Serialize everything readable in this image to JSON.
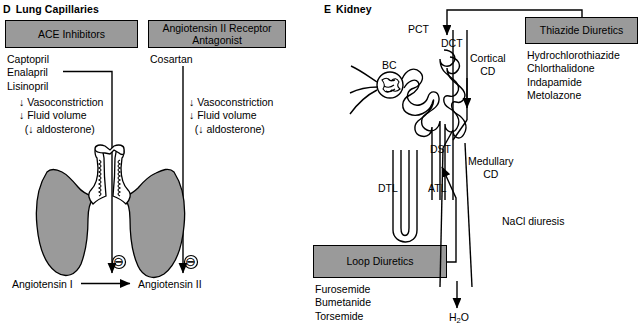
{
  "figure": {
    "panels": [
      {
        "letter": "D",
        "title": "Lung Capillaries",
        "boxes": [
          {
            "label": "ACE Inhibitors"
          },
          {
            "label": "Angiotensin II\nReceptor Antagonist"
          }
        ],
        "drug_lists": [
          {
            "drugs": "Captopril\nEnalapril\nLisinopril"
          },
          {
            "drugs": "Cosartan"
          }
        ],
        "effects": [
          {
            "text": "↓ Vasoconstriction\n↓ Fluid volume\n  (↓ aldosterone)"
          },
          {
            "text": "↓ Vasoconstriction\n↓ Fluid volume\n  (↓ aldosterone)"
          }
        ],
        "reaction": {
          "substrate": "Angiotensin I",
          "product": "Angiotensin II"
        },
        "inhibition_symbol": "⊖",
        "anatomy_label": "lungs-trachea-illustration"
      },
      {
        "letter": "E",
        "title": "Kidney",
        "boxes": [
          {
            "label": "Thiazide Diuretics"
          },
          {
            "label": "Loop Diuretics"
          }
        ],
        "drug_lists": [
          {
            "drugs": "Hydrochlorothiazide\nChlorthalidone\nIndapamide\nMetolazone"
          },
          {
            "drugs": "Furosemide\nBumetanide\nTorsemide"
          }
        ],
        "nephron_labels": [
          {
            "id": "bc",
            "text": "BC"
          },
          {
            "id": "pct",
            "text": "PCT"
          },
          {
            "id": "dct",
            "text": "DCT"
          },
          {
            "id": "dst",
            "text": "DST"
          },
          {
            "id": "dtl",
            "text": "DTL"
          },
          {
            "id": "atl",
            "text": "ATL"
          },
          {
            "id": "cortical-cd",
            "text": "Cortical\nCD"
          },
          {
            "id": "medullary-cd",
            "text": "Medullary\nCD"
          }
        ],
        "annotations": [
          {
            "id": "nacl-diuresis",
            "text": "NaCl diuresis"
          },
          {
            "id": "water-output",
            "text": "H2O"
          }
        ]
      }
    ]
  },
  "colors": {
    "box_fill": "#9a9a9a",
    "lung_fill": "#9a9a9a",
    "stroke": "#000000",
    "background": "#ffffff"
  }
}
